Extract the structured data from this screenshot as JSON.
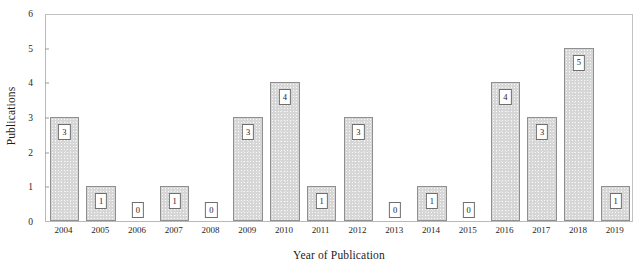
{
  "chart_data": {
    "type": "bar",
    "title": "",
    "xlabel": "Year of Publication",
    "ylabel": "Publications",
    "categories": [
      "2004",
      "2005",
      "2006",
      "2007",
      "2008",
      "2009",
      "2010",
      "2011",
      "2012",
      "2013",
      "2014",
      "2015",
      "2016",
      "2017",
      "2018",
      "2019"
    ],
    "values": [
      3,
      1,
      0,
      1,
      0,
      3,
      4,
      1,
      3,
      0,
      1,
      0,
      4,
      3,
      5,
      1
    ],
    "data_labels": [
      "3",
      "1",
      "0",
      "1",
      "0",
      "3",
      "4",
      "1",
      "3",
      "0",
      "1",
      "0",
      "4",
      "3",
      "5",
      "1"
    ],
    "ylim": [
      0,
      6
    ],
    "yticks": [
      0,
      1,
      2,
      3,
      4,
      5,
      6
    ],
    "ytick_labels": [
      "0",
      "1",
      "2",
      "3",
      "4",
      "5",
      "6"
    ],
    "grid": false,
    "legend": false,
    "bar_color": "#d6d6d6",
    "bar_border_color": "#8f8f8f",
    "axis_color": "#8d8d8d",
    "frame_color": "#b9b9b9",
    "label_box_color": "#ffffff",
    "text_color": "#1a1a1a"
  }
}
